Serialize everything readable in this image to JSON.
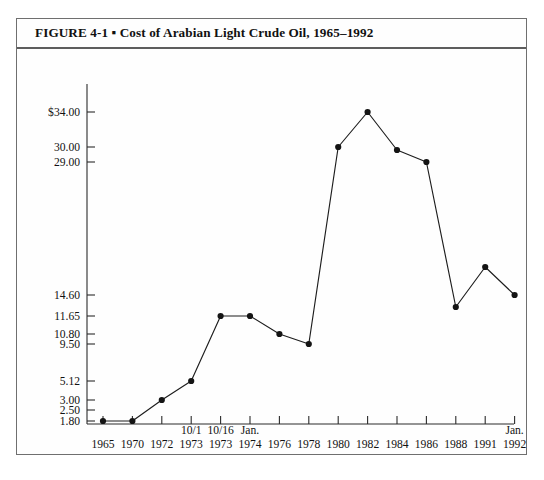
{
  "figure": {
    "title": "FIGURE 4-1 ▪ Cost of Arabian Light Crude Oil, 1965–1992",
    "title_label": "FIGURE 4-1",
    "separator": "▪",
    "caption": "Cost of Arabian Light Crude Oil, 1965–1992"
  },
  "chart_data": {
    "type": "line",
    "title": "Cost of Arabian Light Crude Oil, 1965–1992",
    "xlabel": "",
    "ylabel": "",
    "grid": false,
    "legend": "none",
    "ylim": [
      1.8,
      34.0
    ],
    "y_tick_labels": [
      "$34.00",
      "30.00",
      "29.00",
      "14.60",
      "11.65",
      "10.80",
      "9.50",
      "5.12",
      "3.00",
      "2.50",
      "1.80"
    ],
    "y_tick_values": [
      34.0,
      30.0,
      29.0,
      14.6,
      11.65,
      10.8,
      9.5,
      5.12,
      3.0,
      2.5,
      1.8
    ],
    "categories": [
      "1965",
      "1970",
      "1972",
      "1973",
      "1973",
      "1974",
      "1976",
      "1978",
      "1980",
      "1982",
      "1984",
      "1986",
      "1988",
      "1991",
      "1992"
    ],
    "x_tick_upper_labels": [
      "",
      "",
      "",
      "10/1",
      "10/16",
      "Jan.",
      "",
      "",
      "",
      "",
      "",
      "",
      "",
      "",
      "Jan."
    ],
    "values": [
      1.8,
      1.8,
      3.0,
      5.12,
      11.65,
      11.65,
      10.8,
      9.5,
      30.0,
      34.0,
      29.8,
      29.0,
      12.9,
      16.8,
      14.6
    ],
    "points": [
      {
        "x_label": "1965",
        "x_upper": "",
        "y": 1.8
      },
      {
        "x_label": "1970",
        "x_upper": "",
        "y": 1.8
      },
      {
        "x_label": "1972",
        "x_upper": "",
        "y": 3.0
      },
      {
        "x_label": "1973",
        "x_upper": "10/1",
        "y": 5.12
      },
      {
        "x_label": "1973",
        "x_upper": "10/16",
        "y": 11.65
      },
      {
        "x_label": "1974",
        "x_upper": "Jan.",
        "y": 11.65
      },
      {
        "x_label": "1976",
        "x_upper": "",
        "y": 10.8
      },
      {
        "x_label": "1978",
        "x_upper": "",
        "y": 9.5
      },
      {
        "x_label": "1980",
        "x_upper": "",
        "y": 30.0
      },
      {
        "x_label": "1982",
        "x_upper": "",
        "y": 34.0
      },
      {
        "x_label": "1984",
        "x_upper": "",
        "y": 29.8
      },
      {
        "x_label": "1986",
        "x_upper": "",
        "y": 29.0
      },
      {
        "x_label": "1988",
        "x_upper": "",
        "y": 12.9
      },
      {
        "x_label": "1991",
        "x_upper": "",
        "y": 16.8
      },
      {
        "x_label": "1992",
        "x_upper": "Jan.",
        "y": 14.6
      }
    ],
    "colors": {
      "line": "#1d1d1d",
      "marker": "#141414",
      "axis": "#2b2b2b",
      "frame": "#6f6f6f",
      "background": "#fefefe"
    }
  }
}
